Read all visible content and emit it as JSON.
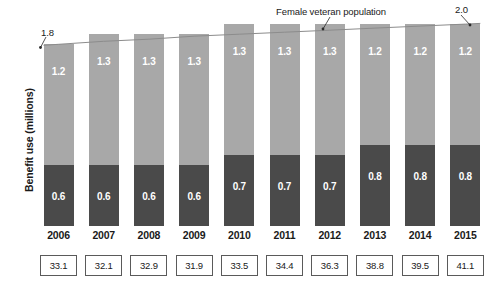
{
  "chart_data": {
    "type": "bar",
    "title": "",
    "subtitle": "",
    "xlabel": "",
    "ylabel": "Benefit use (millions)",
    "grid": false,
    "legend_position": "none",
    "stacked": true,
    "ylim": [
      0,
      2.1
    ],
    "categories": [
      "2006",
      "2007",
      "2008",
      "2009",
      "2010",
      "2011",
      "2012",
      "2013",
      "2014",
      "2015"
    ],
    "series": [
      {
        "name": "benefit-use-lower",
        "color": "#4a4a4a",
        "values": [
          0.6,
          0.6,
          0.6,
          0.6,
          0.7,
          0.7,
          0.7,
          0.8,
          0.8,
          0.8
        ]
      },
      {
        "name": "benefit-use-upper",
        "color": "#a8a8a8",
        "values": [
          1.2,
          1.3,
          1.3,
          1.3,
          1.3,
          1.3,
          1.3,
          1.2,
          1.2,
          1.2
        ]
      }
    ],
    "overlay_line": {
      "name": "Female veteran population",
      "start_value": "1.8",
      "end_value": "2.0",
      "values": [
        1.8,
        1.83,
        1.85,
        1.88,
        1.9,
        1.92,
        1.94,
        1.96,
        1.98,
        2.0
      ]
    },
    "footer_values": [
      "33.1",
      "32.1",
      "32.9",
      "31.9",
      "33.5",
      "34.4",
      "36.3",
      "38.8",
      "39.5",
      "41.1"
    ]
  },
  "annotations": {
    "left_value": "1.8",
    "right_value": "2.0",
    "series_label": "Female veteran population"
  },
  "axis": {
    "y_title": "Benefit use (millions)"
  },
  "colors": {
    "segment_upper": "#a8a8a8",
    "segment_lower": "#4a4a4a",
    "line": "#8c8c8c",
    "box_border": "#5a5a5a",
    "text": "#1a1a1a",
    "label_on_bar": "#ffffff"
  }
}
